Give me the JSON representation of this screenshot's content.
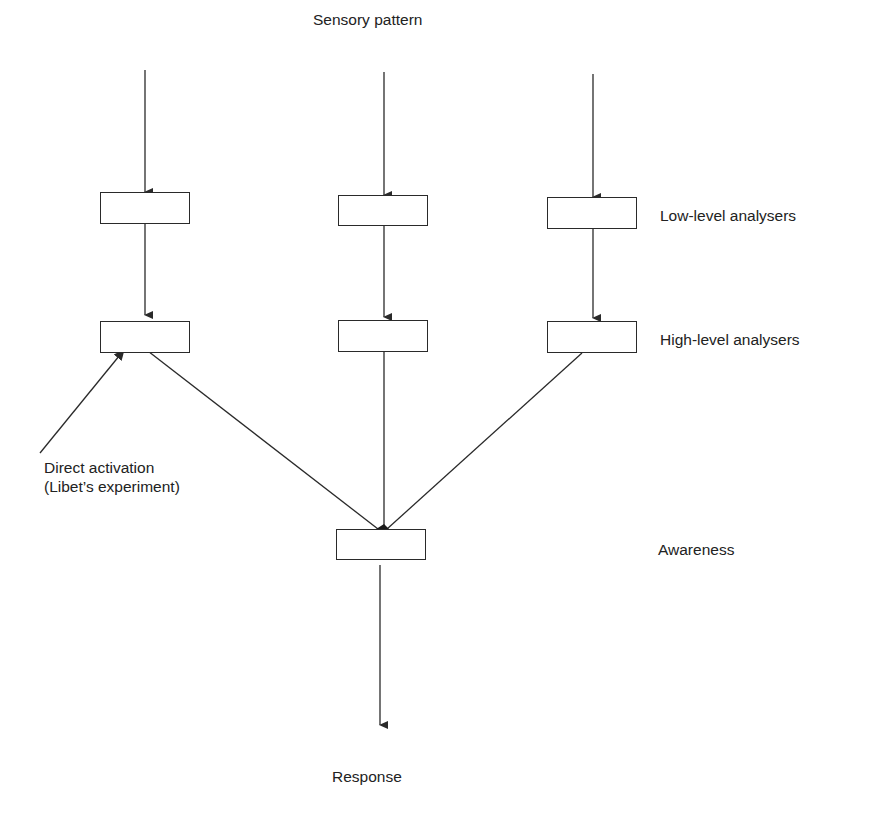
{
  "diagram": {
    "type": "flow",
    "input_label": "Sensory pattern",
    "levels": [
      {
        "id": "low",
        "label": "Low-level analysers"
      },
      {
        "id": "high",
        "label": "High-level analysers"
      },
      {
        "id": "awareness",
        "label": "Awareness"
      }
    ],
    "side_annotation": {
      "line1": "Direct activation",
      "line2": "(Libet’s experiment)"
    },
    "output_label": "Response",
    "columns": 3,
    "stroke_color": "#2a2a2a",
    "text_color": "#222222"
  }
}
